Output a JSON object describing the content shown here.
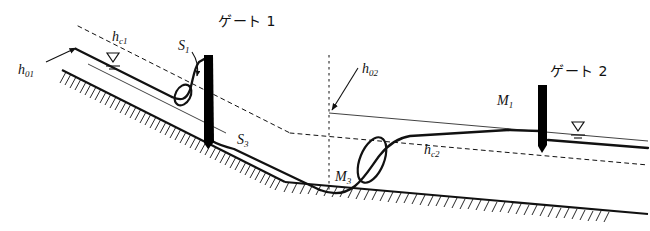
{
  "figure": {
    "type": "hydraulic-open-channel-profile-diagram",
    "background_color": "#ffffff",
    "line_color": "#111111",
    "gate_color": "#000000",
    "width": 650,
    "height": 231
  },
  "labels": {
    "h01": {
      "base": "h",
      "sub": "01",
      "x": 18,
      "y": 63
    },
    "hc1": {
      "base": "h",
      "sub": "c1",
      "x": 112,
      "y": 30
    },
    "s1": {
      "base": "S",
      "sub": "1",
      "x": 178,
      "y": 39
    },
    "gate1": {
      "text": "ゲート 1",
      "x": 218,
      "y": 14
    },
    "s3": {
      "base": "S",
      "sub": "3",
      "x": 237,
      "y": 133
    },
    "m3": {
      "base": "M",
      "sub": "3",
      "x": 335,
      "y": 170
    },
    "h02": {
      "base": "h",
      "sub": "02",
      "x": 362,
      "y": 62
    },
    "hc2": {
      "base": "h",
      "sub": "c2",
      "x": 424,
      "y": 143
    },
    "m1": {
      "base": "M",
      "sub": "1",
      "x": 497,
      "y": 94
    },
    "gate2": {
      "text": "ゲート 2",
      "x": 550,
      "y": 64
    }
  },
  "elements": {
    "gate1_name": "sluice-gate-1",
    "gate2_name": "sluice-gate-2",
    "jump1_name": "hydraulic-jump-upstream-gate-1",
    "jump2_name": "hydraulic-jump-downstream-reach",
    "bed_name": "channel-bed-hatched",
    "water_surface_name": "water-surface-profile",
    "critical_depth_1_name": "critical-depth-line-hc1",
    "critical_depth_2_name": "critical-depth-line-hc2",
    "normal_depth_1_name": "normal-depth-line-h01",
    "normal_depth_2_name": "normal-depth-line-h02",
    "section_divider_name": "slope-break-vertical-dashed-line",
    "wl_symbol_1_name": "water-level-symbol-upstream",
    "wl_symbol_2_name": "water-level-symbol-downstream"
  }
}
